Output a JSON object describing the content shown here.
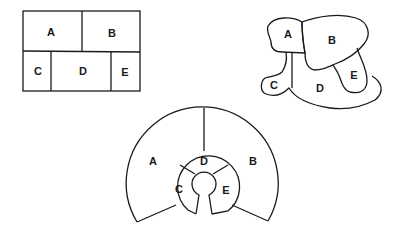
{
  "diagrams": [
    {
      "name": "rectangular-partition",
      "regions": [
        {
          "label": "A",
          "x": 51,
          "y": 32
        },
        {
          "label": "B",
          "x": 112,
          "y": 33
        },
        {
          "label": "C",
          "x": 38,
          "y": 71
        },
        {
          "label": "D",
          "x": 83,
          "y": 71
        },
        {
          "label": "E",
          "x": 125,
          "y": 72
        }
      ]
    },
    {
      "name": "blob-partition",
      "regions": [
        {
          "label": "A",
          "x": 288,
          "y": 34
        },
        {
          "label": "B",
          "x": 332,
          "y": 40
        },
        {
          "label": "C",
          "x": 274,
          "y": 85
        },
        {
          "label": "D",
          "x": 320,
          "y": 88
        },
        {
          "label": "E",
          "x": 354,
          "y": 75
        }
      ]
    },
    {
      "name": "radial-partition",
      "regions": [
        {
          "label": "A",
          "x": 153,
          "y": 161
        },
        {
          "label": "B",
          "x": 253,
          "y": 161
        },
        {
          "label": "C",
          "x": 179,
          "y": 189
        },
        {
          "label": "D",
          "x": 204,
          "y": 161
        },
        {
          "label": "E",
          "x": 226,
          "y": 190
        }
      ]
    }
  ],
  "colors": {
    "stroke": "#1a1a1a",
    "background": "#ffffff"
  }
}
